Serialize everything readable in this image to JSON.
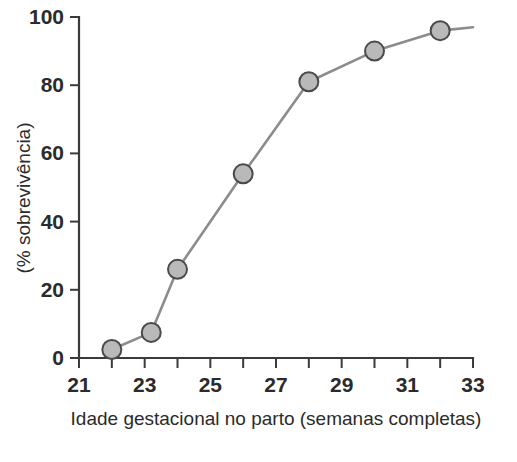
{
  "chart_data": {
    "type": "line",
    "title": "",
    "subtitle": "",
    "xlabel": "Idade gestacional no parto (semanas completas)",
    "ylabel": "(% sobrevivência)",
    "xlim": [
      21,
      33
    ],
    "ylim": [
      0,
      100
    ],
    "grid": false,
    "legend": null,
    "x_ticks": [
      21,
      22,
      23,
      24,
      25,
      26,
      27,
      28,
      29,
      30,
      31,
      32,
      33
    ],
    "x_tick_labels": [
      "21",
      "",
      "23",
      "",
      "25",
      "",
      "27",
      "",
      "29",
      "",
      "31",
      "",
      "33"
    ],
    "y_ticks": [
      0,
      20,
      40,
      60,
      80,
      100
    ],
    "y_tick_labels": [
      "0",
      "20",
      "40",
      "60",
      "80",
      "100"
    ],
    "marker": {
      "shape": "circle",
      "fill_color": "#b9b9b9",
      "edge_color": "#4a4a4a"
    },
    "line_color": "#8c8c8c",
    "series": [
      {
        "name": "sobrevivência",
        "x": [
          22,
          23.2,
          24,
          26,
          28,
          30,
          32
        ],
        "values": [
          2.5,
          7.5,
          26,
          54,
          81,
          90,
          96
        ]
      }
    ],
    "line_extends_to_x": 33,
    "line_end_value": 97
  },
  "axes": {
    "x_axis_name": "idade-gestacional-axis",
    "y_axis_name": "sobrevivencia-axis"
  },
  "colors": {
    "axis": "#3b3b3b",
    "text": "#2b2b2b",
    "line": "#8c8c8c",
    "marker_fill": "#b9b9b9",
    "marker_edge": "#4a4a4a",
    "background": "#ffffff"
  },
  "caption_fragment": ""
}
